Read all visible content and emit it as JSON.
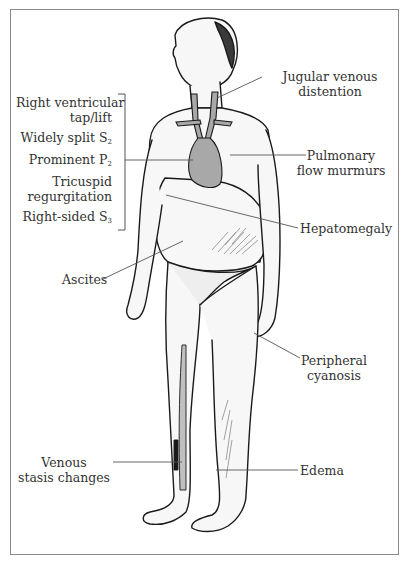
{
  "figure": {
    "left_bracket_labels": [
      {
        "line1": "Right ventricular",
        "line2": "tap/lift"
      },
      {
        "text": "Widely split S",
        "sub": "2"
      },
      {
        "text": "Prominent P",
        "sub": "2"
      },
      {
        "line1": "Tricuspid",
        "line2": "regurgitation"
      },
      {
        "text": "Right-sided S",
        "sub": "3"
      }
    ],
    "labels": {
      "jugular": {
        "line1": "Jugular venous",
        "line2": "distention"
      },
      "pulmonary": {
        "line1": "Pulmonary",
        "line2": "flow murmurs"
      },
      "hepatomegaly": "Hepatomegaly",
      "ascites": "Ascites",
      "peripheral": {
        "line1": "Peripheral",
        "line2": "cyanosis"
      },
      "venous": {
        "line1": "Venous",
        "line2": "stasis changes"
      },
      "edema": "Edema"
    },
    "colors": {
      "outline": "#1a1a1a",
      "fill_gray": "#b5b5b5",
      "heart_fill": "#a8a8a8",
      "skin": "#f7f7f7",
      "frame": "#8a8a8a",
      "leader": "#555555"
    }
  }
}
